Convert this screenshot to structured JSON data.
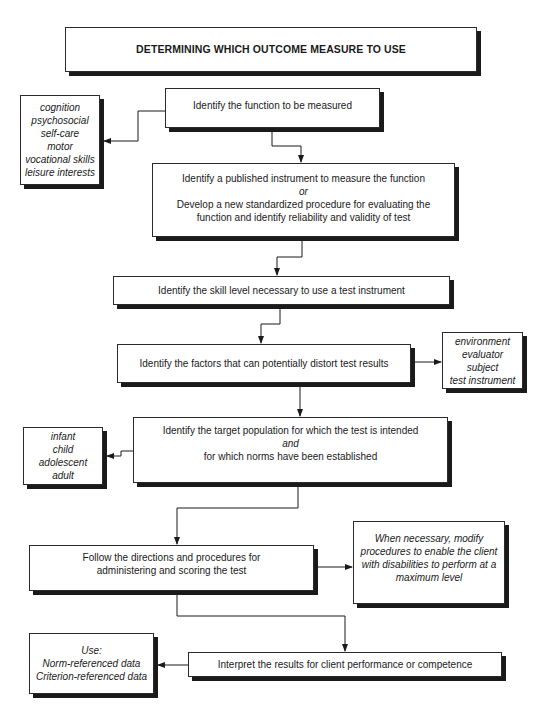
{
  "title": "DETERMINING WHICH OUTCOME MEASURE TO USE",
  "steps": {
    "function": "Identify the function to be measured",
    "instrument": {
      "line1": "Identify a published instrument to measure the function",
      "connector": "or",
      "line2": "Develop a new standardized procedure for evaluating the",
      "line3": "function and identify reliability and validity of test"
    },
    "skill": "Identify the skill level necessary to use a test instrument",
    "factors": "Identify the  factors that can potentially distort test results",
    "population": {
      "line1": "Identify the target population for which the test is intended",
      "connector": "and",
      "line2": "for which norms have been established"
    },
    "directions": {
      "line1": "Follow the directions and procedures for",
      "line2": "administering and scoring the test"
    },
    "interpret": "Interpret the results for client performance or competence"
  },
  "side_notes": {
    "functions": [
      "cognition",
      "psychosocial",
      "self-care",
      "motor",
      "vocational skills",
      "leisure interests"
    ],
    "distortion_factors": [
      "environment",
      "evaluator",
      "subject",
      "test instrument"
    ],
    "populations": [
      "infant",
      "child",
      "adolescent",
      "adult"
    ],
    "modify": [
      "When necessary, modify",
      "procedures to enable the client",
      "with disabilities to perform at a",
      "maximum level"
    ],
    "use": [
      "Use:",
      "Norm-referenced data",
      "Criterion-referenced data"
    ]
  },
  "colors": {
    "line": "#1a1a1a",
    "shadow": "#1a1a1a",
    "border": "#2a2a2a",
    "background": "#ffffff"
  }
}
